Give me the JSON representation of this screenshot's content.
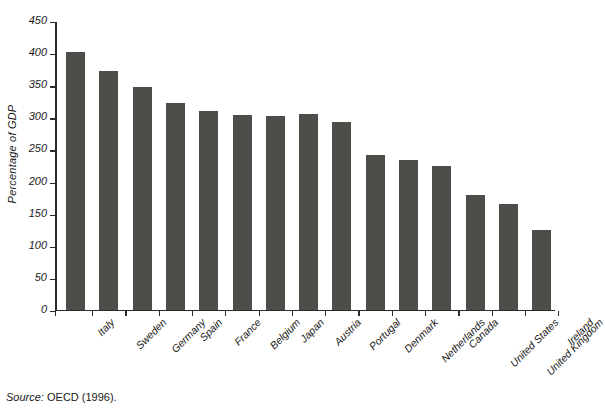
{
  "figure": {
    "background_color": "#ffffff",
    "bar_color": "#4d4d4a",
    "axis_color": "#2b2b2b",
    "source_note": {
      "label": "Source:",
      "text": "OECD (1996)."
    }
  },
  "chart_data": {
    "type": "bar",
    "title": "",
    "xlabel": "",
    "ylabel": "Percentage of GDP",
    "ylim": [
      0,
      450
    ],
    "ytick_step": 50,
    "yticks": [
      0,
      50,
      100,
      150,
      200,
      250,
      300,
      350,
      400,
      450
    ],
    "ytick_labels": [
      "0",
      "50",
      "100",
      "150",
      "200",
      "250",
      "300",
      "350",
      "400",
      "450"
    ],
    "grid": false,
    "legend": false,
    "categories": [
      "Italy",
      "Sweden",
      "Germany",
      "Spain",
      "France",
      "Belgium",
      "Japan",
      "Austria",
      "Portugal",
      "Denmark",
      "Netherlands",
      "Canada",
      "United States",
      "United Kingdom",
      "Ireland"
    ],
    "values": [
      401,
      371,
      346,
      321,
      309,
      303,
      302,
      304,
      292,
      241,
      233,
      224,
      178,
      165,
      124
    ]
  }
}
